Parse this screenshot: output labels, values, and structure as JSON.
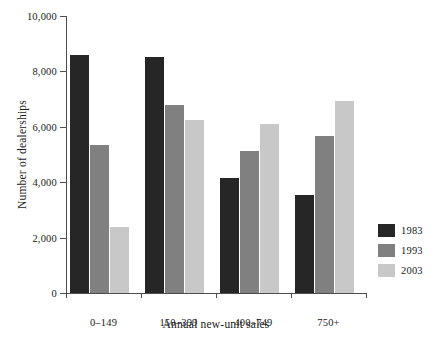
{
  "chart_data": {
    "type": "bar",
    "title": "",
    "xlabel": "Annual new-unit sales",
    "ylabel": "Number of dealerships",
    "categories": [
      "0–149",
      "150–399",
      "400–749",
      "750+"
    ],
    "series": [
      {
        "name": "1983",
        "color": "#262626",
        "values": [
          8600,
          8520,
          4150,
          3540
        ]
      },
      {
        "name": "1993",
        "color": "#808080",
        "values": [
          5340,
          6790,
          5110,
          5680
        ]
      },
      {
        "name": "2003",
        "color": "#c8c8c8",
        "values": [
          2380,
          6250,
          6090,
          6930
        ]
      }
    ],
    "ylim": [
      0,
      10000
    ],
    "ytick_labels": [
      "10,000",
      "8,000",
      "6,000",
      "4,000",
      "2,000",
      "0"
    ],
    "ytick_values": [
      10000,
      8000,
      6000,
      4000,
      2000,
      0
    ],
    "grid": false,
    "legend_position": "bottom-right",
    "legend_entries": [
      "1983",
      "1993",
      "2003"
    ]
  }
}
